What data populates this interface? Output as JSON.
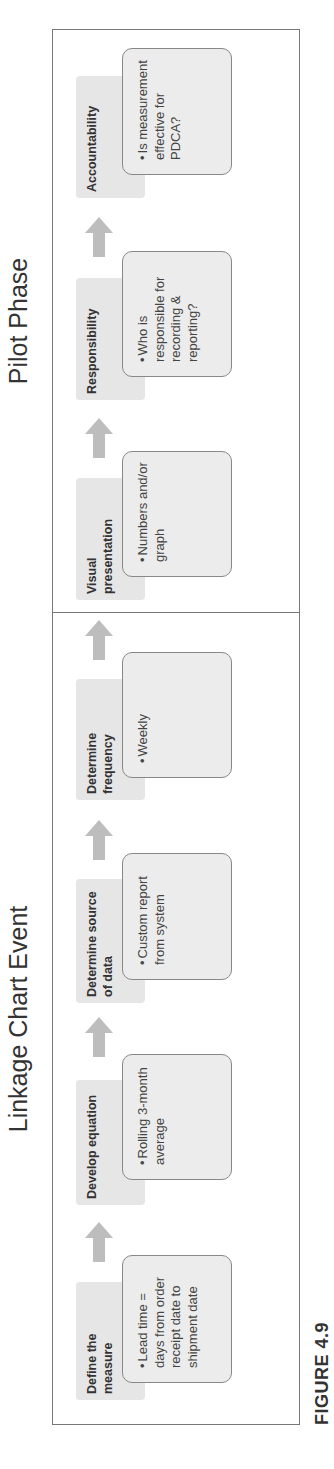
{
  "sections": {
    "left_title": "Linkage Chart Event",
    "right_title": "Pilot Phase"
  },
  "steps": [
    {
      "label": "Define the measure",
      "content": "Lead time = days from order receipt date to shipment date"
    },
    {
      "label": "Develop equation",
      "content": "Rolling 3-month average"
    },
    {
      "label": "Determine source of data",
      "content": "Custom report from system"
    },
    {
      "label": "Determine frequency",
      "content": "Weekly"
    },
    {
      "label": "Visual presentation",
      "content": "Numbers and/or graph"
    },
    {
      "label": "Responsibility",
      "content": "Who is responsible for recording & reporting?"
    },
    {
      "label": "Accountability",
      "content": "Is measurement effective for PDCA?"
    }
  ],
  "bullet": "•",
  "caption": "FIGURE 4.9",
  "colors": {
    "label_fill": "#e6e6e6",
    "content_fill": "#ececec",
    "arrow": "#bdbdbd",
    "border": "#777777"
  }
}
